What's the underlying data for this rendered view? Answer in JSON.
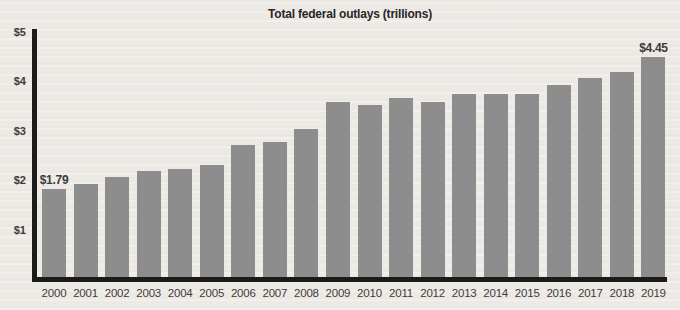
{
  "chart_data": {
    "type": "bar",
    "title": "Total federal outlays (trillions)",
    "categories": [
      "2000",
      "2001",
      "2002",
      "2003",
      "2004",
      "2005",
      "2006",
      "2007",
      "2008",
      "2009",
      "2010",
      "2011",
      "2012",
      "2013",
      "2014",
      "2015",
      "2016",
      "2017",
      "2018",
      "2019"
    ],
    "values": [
      1.79,
      1.88,
      2.02,
      2.14,
      2.19,
      2.26,
      2.67,
      2.74,
      2.99,
      3.55,
      3.48,
      3.63,
      3.55,
      3.71,
      3.71,
      3.7,
      3.88,
      4.02,
      4.15,
      4.45
    ],
    "xlabel": "",
    "ylabel": "",
    "ylim": [
      0,
      5
    ],
    "grid": false,
    "legend": "none",
    "y_tick_labels": [
      "$5",
      "$4",
      "$3",
      "$2",
      "$1"
    ],
    "y_tick_values": [
      5,
      4,
      3,
      2,
      1
    ],
    "annotations": [
      {
        "index": 0,
        "text": "$1.79"
      },
      {
        "index": 19,
        "text": "$4.45"
      }
    ],
    "colors": {
      "bar": "#8d8d8d",
      "background": "#edeae5",
      "axis": "#1b1b1a",
      "label": "#3c3b39",
      "title": "#262626"
    }
  }
}
